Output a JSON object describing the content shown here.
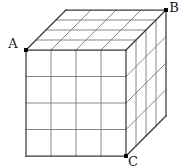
{
  "figure": {
    "shape": "cube",
    "divisions_per_edge": 4,
    "background_color": "#ffffff",
    "outline_color": "#3a3a3a",
    "grid_color": "#7a7a7a",
    "marker_color": "#000000",
    "label_color": "#1a1a1a",
    "geometry": {
      "front_face": {
        "left": 26,
        "top": 50,
        "right": 126,
        "bottom": 156
      },
      "depth_offset": {
        "dx": 40,
        "dy": -40
      }
    },
    "vertices": [
      {
        "id": "A",
        "label": "A",
        "position": "front-top-left",
        "x": 26,
        "y": 50,
        "label_x": 13,
        "label_y": 48,
        "label_anchor": "middle"
      },
      {
        "id": "B",
        "label": "B",
        "position": "back-top-right",
        "x": 166,
        "y": 10,
        "label_x": 174,
        "label_y": 12,
        "label_anchor": "middle"
      },
      {
        "id": "C",
        "label": "C",
        "position": "front-bottom-right",
        "x": 126,
        "y": 156,
        "label_x": 133,
        "label_y": 166,
        "label_anchor": "middle"
      }
    ],
    "marker_size": 4
  }
}
